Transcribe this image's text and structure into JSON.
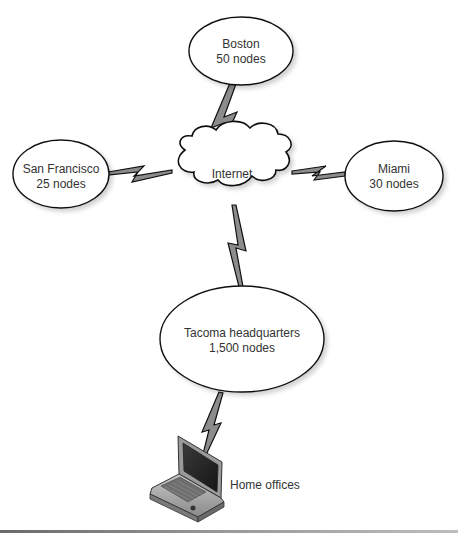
{
  "diagram": {
    "type": "network-topology",
    "colors": {
      "stroke": "#111111",
      "link_fill": "#8c8c8c",
      "node_fill": "#ffffff",
      "text": "#333333"
    },
    "hub": {
      "id": "internet",
      "label": "Internet"
    },
    "sites": [
      {
        "id": "boston",
        "name": "Boston",
        "nodes": "50 nodes"
      },
      {
        "id": "san-francisco",
        "name": "San Francisco",
        "nodes": "25 nodes"
      },
      {
        "id": "miami",
        "name": "Miami",
        "nodes": "30 nodes"
      },
      {
        "id": "tacoma",
        "name": "Tacoma headquarters",
        "nodes": "1,500 nodes"
      }
    ],
    "remote": {
      "id": "home-offices",
      "label": "Home offices",
      "icon": "laptop-icon"
    },
    "links": [
      {
        "from": "boston",
        "to": "internet",
        "style": "lightning-bolt"
      },
      {
        "from": "san-francisco",
        "to": "internet",
        "style": "lightning-bolt"
      },
      {
        "from": "miami",
        "to": "internet",
        "style": "lightning-bolt"
      },
      {
        "from": "internet",
        "to": "tacoma",
        "style": "lightning-bolt"
      },
      {
        "from": "tacoma",
        "to": "home-offices",
        "style": "lightning-bolt"
      }
    ]
  }
}
